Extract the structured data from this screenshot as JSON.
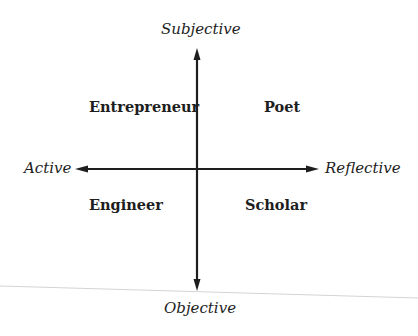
{
  "diagram": {
    "type": "quadrant",
    "axes": {
      "vertical": {
        "top": "Subjective",
        "bottom": "Objective"
      },
      "horizontal": {
        "left": "Active",
        "right": "Reflective"
      }
    },
    "quadrants": {
      "top_left": "Entrepreneur",
      "top_right": "Poet",
      "bottom_left": "Engineer",
      "bottom_right": "Scholar"
    },
    "colors": {
      "ink": "#1e1e1e",
      "background": "#ffffff",
      "scan_line": "#d4d4d4"
    }
  }
}
